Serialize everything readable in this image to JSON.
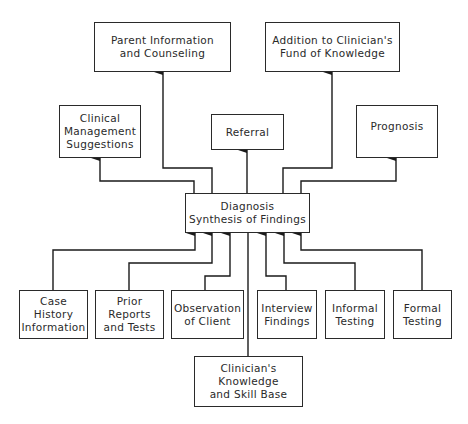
{
  "diagram": {
    "center": {
      "label": "Diagnosis\nSynthesis of Findings"
    },
    "outputs": [
      {
        "id": "parent",
        "label": "Parent Information\nand Counseling"
      },
      {
        "id": "addition",
        "label": "Addition to Clinician's\nFund of Knowledge"
      },
      {
        "id": "clinical",
        "label": "Clinical\nManagement\nSuggestions"
      },
      {
        "id": "referral",
        "label": "Referral"
      },
      {
        "id": "prognosis",
        "label": "Prognosis"
      }
    ],
    "inputs": [
      {
        "id": "case",
        "label": "Case\nHistory\nInformation"
      },
      {
        "id": "prior",
        "label": "Prior\nReports\nand Tests"
      },
      {
        "id": "observation",
        "label": "Observation\nof Client"
      },
      {
        "id": "interview",
        "label": "Interview\nFindings"
      },
      {
        "id": "informal",
        "label": "Informal\nTesting"
      },
      {
        "id": "formal",
        "label": "Formal\nTesting"
      }
    ],
    "base": {
      "label": "Clinician's\nKnowledge\nand Skill Base"
    }
  }
}
